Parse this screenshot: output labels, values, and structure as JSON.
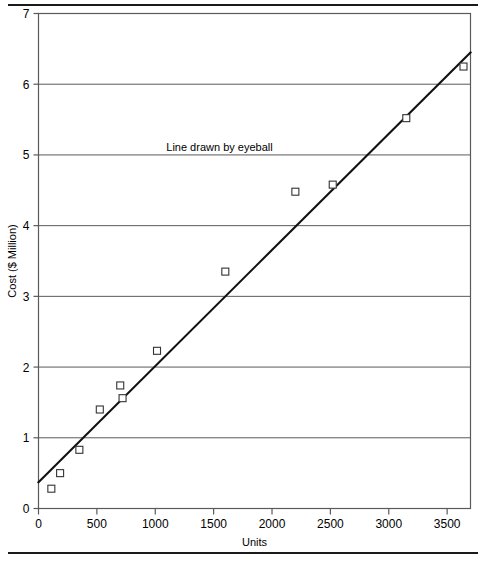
{
  "chart_data": {
    "type": "scatter",
    "title": "",
    "xlabel": "Units",
    "ylabel": "Cost ($ Million)",
    "xlim": [
      0,
      3700
    ],
    "ylim": [
      0,
      7
    ],
    "xticks": [
      0,
      500,
      1000,
      1500,
      2000,
      2500,
      3000,
      3500
    ],
    "xtick_labels": [
      "0",
      "500",
      "1000",
      "1500",
      "2000",
      "2500",
      "3000",
      "3500"
    ],
    "yticks": [
      0,
      1,
      2,
      3,
      4,
      5,
      6,
      7
    ],
    "ytick_labels": [
      "0",
      "1",
      "2",
      "3",
      "4",
      "5",
      "6",
      "7"
    ],
    "grid": "horizontal",
    "legend": "none",
    "marker": "open-square",
    "points": [
      {
        "x": 110,
        "y": 0.28
      },
      {
        "x": 185,
        "y": 0.5
      },
      {
        "x": 350,
        "y": 0.83
      },
      {
        "x": 525,
        "y": 1.4
      },
      {
        "x": 700,
        "y": 1.74
      },
      {
        "x": 720,
        "y": 1.56
      },
      {
        "x": 1015,
        "y": 2.23
      },
      {
        "x": 1600,
        "y": 3.35
      },
      {
        "x": 2200,
        "y": 4.48
      },
      {
        "x": 2520,
        "y": 4.58
      },
      {
        "x": 3150,
        "y": 5.52
      },
      {
        "x": 3640,
        "y": 6.25
      }
    ],
    "trend_line": {
      "label": "Line drawn by eyeball",
      "x_start": 0,
      "y_start": 0.37,
      "x_end": 3700,
      "y_end": 6.45
    },
    "annotations": [
      {
        "text": "Line drawn by eyeball",
        "x": 1550,
        "y": 5.05
      }
    ]
  },
  "colors": {
    "axis": "#5a5a5a",
    "grid": "#5a5a5a",
    "line": "#111111",
    "marker": "#333333",
    "rule": "#1a1a1a",
    "text": "#000000"
  }
}
